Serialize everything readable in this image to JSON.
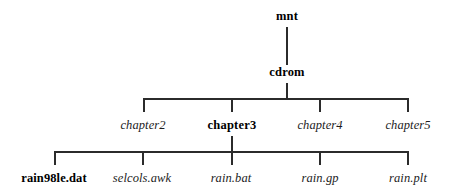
{
  "diagram": {
    "type": "directory-tree",
    "background_color": "#ffffff",
    "line_color": "#2b2b2b",
    "text_color": "#000000",
    "levels": [
      {
        "name": "root-level",
        "nodes": [
          {
            "label": "mnt",
            "style": "bold",
            "x": 287,
            "y": 16
          }
        ]
      },
      {
        "name": "mount-level",
        "nodes": [
          {
            "label": "cdrom",
            "style": "bold",
            "x": 287,
            "y": 72
          }
        ]
      },
      {
        "name": "chapter-level",
        "nodes": [
          {
            "label": "chapter2",
            "style": "italic",
            "x": 143,
            "y": 125
          },
          {
            "label": "chapter3",
            "style": "bold",
            "x": 232,
            "y": 125
          },
          {
            "label": "chapter4",
            "style": "italic",
            "x": 320,
            "y": 125
          },
          {
            "label": "chapter5",
            "style": "italic",
            "x": 408,
            "y": 125
          }
        ]
      },
      {
        "name": "file-level",
        "nodes": [
          {
            "label": "rain98le.dat",
            "style": "bold",
            "x": 54,
            "y": 178
          },
          {
            "label": "selcols.awk",
            "style": "italic",
            "x": 142,
            "y": 178
          },
          {
            "label": "rain.bat",
            "style": "italic",
            "x": 231,
            "y": 178
          },
          {
            "label": "rain.gp",
            "style": "italic",
            "x": 320,
            "y": 178
          },
          {
            "label": "rain.plt",
            "style": "italic",
            "x": 408,
            "y": 178
          }
        ]
      }
    ]
  }
}
